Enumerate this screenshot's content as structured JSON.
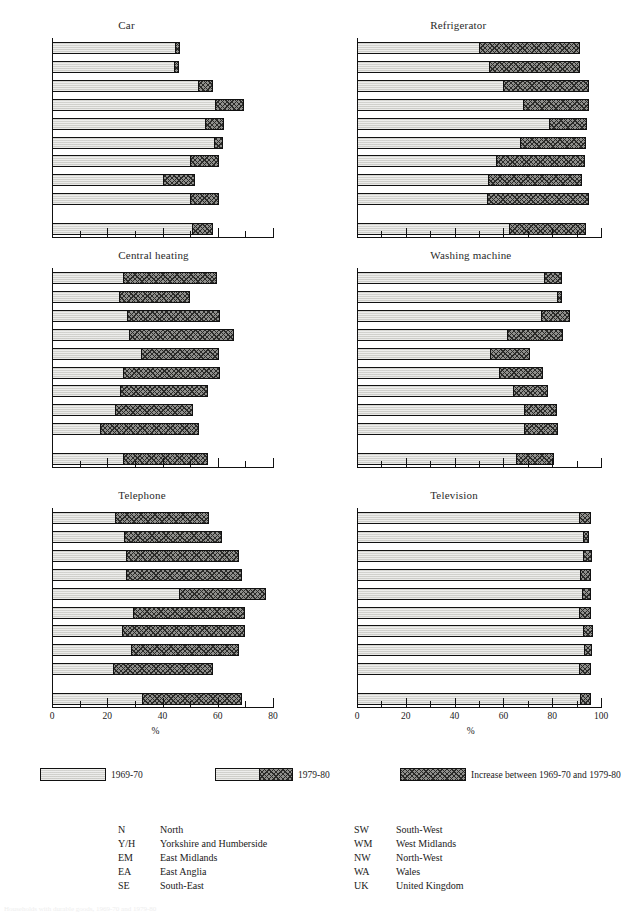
{
  "chart_data": [
    {
      "type": "bar",
      "title": "Car",
      "xlabel": "%",
      "ylabel": "",
      "xlim": [
        0,
        80
      ],
      "xticks": [
        0,
        20,
        40,
        60,
        80
      ],
      "xminorticks": [
        10,
        30,
        50,
        70
      ],
      "grid": false,
      "orientation": "horizontal",
      "stacked": true,
      "categories": [
        "N",
        "Y/H",
        "EM",
        "EA",
        "SE",
        "SW",
        "WM",
        "NW",
        "WA",
        "UK"
      ],
      "series": [
        {
          "name": "1969-70",
          "values": [
            44.5,
            44.0,
            53.0,
            59.0,
            55.5,
            58.5,
            50.0,
            40.0,
            50.0,
            50.5
          ]
        },
        {
          "name": "Increase between 1969-70 and 1979-80",
          "values": [
            1.5,
            1.5,
            5.0,
            10.0,
            6.5,
            3.0,
            10.0,
            11.5,
            10.0,
            7.5
          ]
        }
      ],
      "totals_1979_80": [
        46.0,
        45.5,
        58.0,
        69.0,
        62.0,
        61.5,
        60.0,
        51.5,
        60.0,
        58.0
      ]
    },
    {
      "type": "bar",
      "title": "Refrigerator",
      "xlabel": "%",
      "ylabel": "",
      "xlim": [
        0,
        100
      ],
      "xticks": [
        0,
        20,
        40,
        60,
        80,
        100
      ],
      "xminorticks": [
        10,
        30,
        50,
        70,
        90
      ],
      "grid": false,
      "orientation": "horizontal",
      "stacked": true,
      "categories": [
        "N",
        "Y/H",
        "EM",
        "EA",
        "SE",
        "SW",
        "WM",
        "NW",
        "WA",
        "UK"
      ],
      "series": [
        {
          "name": "1969-70",
          "values": [
            50.0,
            54.0,
            59.5,
            68.0,
            78.5,
            66.5,
            57.0,
            53.5,
            53.0,
            62.0
          ]
        },
        {
          "name": "Increase between 1969-70 and 1979-80",
          "values": [
            41.0,
            37.0,
            35.0,
            26.5,
            15.5,
            27.0,
            36.0,
            38.5,
            41.5,
            31.5
          ]
        }
      ],
      "totals_1979_80": [
        91.0,
        91.0,
        94.5,
        94.5,
        94.0,
        93.5,
        93.0,
        92.0,
        94.5,
        93.5
      ]
    },
    {
      "type": "bar",
      "title": "Central heating",
      "xlabel": "%",
      "ylabel": "",
      "xlim": [
        0,
        80
      ],
      "xticks": [
        0,
        20,
        40,
        60,
        80
      ],
      "xminorticks": [
        10,
        30,
        50,
        70
      ],
      "grid": false,
      "orientation": "horizontal",
      "stacked": true,
      "categories": [
        "N",
        "Y/H",
        "EM",
        "EA",
        "SE",
        "SW",
        "WM",
        "NW",
        "WA",
        "UK"
      ],
      "series": [
        {
          "name": "1969-70",
          "values": [
            25.5,
            24.0,
            27.0,
            27.5,
            32.0,
            25.5,
            24.5,
            22.5,
            17.0,
            25.5
          ]
        },
        {
          "name": "Increase between 1969-70 and 1979-80",
          "values": [
            34.0,
            25.5,
            33.5,
            38.0,
            28.0,
            35.0,
            31.5,
            28.0,
            36.0,
            30.5
          ]
        }
      ],
      "totals_1979_80": [
        59.5,
        49.5,
        60.5,
        65.5,
        60.0,
        60.5,
        56.0,
        50.5,
        53.0,
        56.0
      ]
    },
    {
      "type": "bar",
      "title": "Washing machine",
      "xlabel": "%",
      "ylabel": "",
      "xlim": [
        0,
        100
      ],
      "xticks": [
        0,
        20,
        40,
        60,
        80,
        100
      ],
      "xminorticks": [
        10,
        30,
        50,
        70,
        90
      ],
      "grid": false,
      "orientation": "horizontal",
      "stacked": true,
      "categories": [
        "N",
        "Y/H",
        "EM",
        "EA",
        "SE",
        "SW",
        "WM",
        "NW",
        "WA",
        "UK"
      ],
      "series": [
        {
          "name": "1969-70",
          "values": [
            76.5,
            82.0,
            75.5,
            61.5,
            54.5,
            58.0,
            64.0,
            68.5,
            68.5,
            65.0
          ]
        },
        {
          "name": "Increase between 1969-70 and 1979-80",
          "values": [
            7.0,
            1.5,
            11.5,
            22.5,
            16.0,
            18.0,
            14.0,
            13.0,
            13.5,
            15.5
          ]
        }
      ],
      "totals_1979_80": [
        83.5,
        83.5,
        87.0,
        84.0,
        70.5,
        76.0,
        78.0,
        81.5,
        82.0,
        80.5
      ]
    },
    {
      "type": "bar",
      "title": "Telephone",
      "xlabel": "%",
      "ylabel": "",
      "xlim": [
        0,
        80
      ],
      "xticks": [
        0,
        20,
        40,
        60,
        80
      ],
      "xminorticks": [
        10,
        30,
        50,
        70
      ],
      "grid": false,
      "orientation": "horizontal",
      "stacked": true,
      "categories": [
        "N",
        "Y/H",
        "EM",
        "EA",
        "SE",
        "SW",
        "WM",
        "NW",
        "WA",
        "UK"
      ],
      "series": [
        {
          "name": "1969-70",
          "values": [
            22.5,
            26.0,
            26.5,
            26.5,
            46.0,
            29.0,
            25.0,
            28.5,
            22.0,
            32.5
          ]
        },
        {
          "name": "Increase between 1969-70 and 1979-80",
          "values": [
            34.0,
            35.0,
            41.0,
            42.0,
            31.0,
            40.5,
            44.5,
            39.0,
            36.0,
            36.0
          ]
        }
      ],
      "totals_1979_80": [
        56.5,
        61.0,
        67.5,
        68.5,
        77.0,
        69.5,
        69.5,
        67.5,
        58.0,
        68.5
      ]
    },
    {
      "type": "bar",
      "title": "Television",
      "xlabel": "%",
      "ylabel": "",
      "xlim": [
        0,
        100
      ],
      "xticks": [
        0,
        20,
        40,
        60,
        80,
        100
      ],
      "xminorticks": [
        10,
        30,
        50,
        70,
        90
      ],
      "grid": false,
      "orientation": "horizontal",
      "stacked": true,
      "categories": [
        "N",
        "Y/H",
        "EM",
        "EA",
        "SE",
        "SW",
        "WM",
        "NW",
        "WA",
        "UK"
      ],
      "series": [
        {
          "name": "1969-70",
          "values": [
            91.0,
            92.5,
            92.5,
            91.5,
            92.0,
            91.0,
            92.5,
            93.0,
            91.0,
            91.5
          ]
        },
        {
          "name": "Increase between 1969-70 and 1979-80",
          "values": [
            4.5,
            2.0,
            3.5,
            4.0,
            3.5,
            4.5,
            4.0,
            3.0,
            4.5,
            4.0
          ]
        }
      ],
      "totals_1979_80": [
        95.5,
        94.5,
        96.0,
        95.5,
        95.5,
        95.5,
        96.5,
        96.0,
        95.5,
        95.5
      ]
    }
  ],
  "legend": {
    "items": [
      {
        "label": "1969-70",
        "kind": "base"
      },
      {
        "label": "1979-80",
        "kind": "base-plus-increase"
      },
      {
        "label": "Increase between 1969-70 and 1979-80",
        "kind": "increase"
      }
    ]
  },
  "key": {
    "left": [
      {
        "abbr": "N",
        "name": "North"
      },
      {
        "abbr": "Y/H",
        "name": "Yorkshire and Humberside"
      },
      {
        "abbr": "EM",
        "name": "East Midlands"
      },
      {
        "abbr": "EA",
        "name": "East Anglia"
      },
      {
        "abbr": "SE",
        "name": "South-East"
      }
    ],
    "right": [
      {
        "abbr": "SW",
        "name": "South-West"
      },
      {
        "abbr": "WM",
        "name": "West Midlands"
      },
      {
        "abbr": "NW",
        "name": "North-West"
      },
      {
        "abbr": "WA",
        "name": "Wales"
      },
      {
        "abbr": "UK",
        "name": "United Kingdom"
      }
    ]
  },
  "footnote": "Households with durable goods, 1969-70 and 1979-80"
}
